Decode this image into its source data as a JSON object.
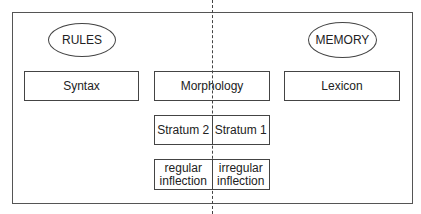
{
  "diagram": {
    "ellipses": {
      "rules": "RULES",
      "memory": "MEMORY"
    },
    "top_row": {
      "syntax": "Syntax",
      "morphology": "Morphology",
      "lexicon": "Lexicon"
    },
    "strata": {
      "left": "Stratum 2",
      "right": "Stratum 1"
    },
    "inflection": {
      "left_line1": "regular",
      "left_line2": "inflection",
      "right_line1": "irregular",
      "right_line2": "inflection"
    },
    "divider": "dashed-vertical-line"
  }
}
